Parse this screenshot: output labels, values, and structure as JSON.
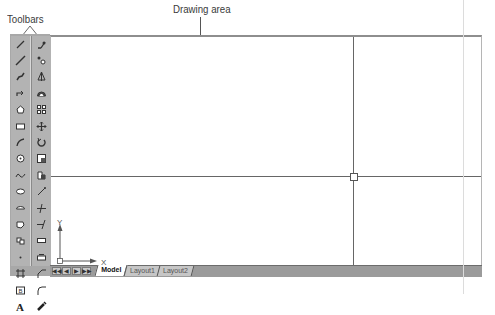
{
  "callouts": {
    "toolbars": "Toolbars",
    "drawing_area": "Drawing area",
    "crosshair_cursor": "Crosshair cursor",
    "ucs_icon_line1": "User Coordinate",
    "ucs_icon_line2": "System icon",
    "model_layout_tabs": "Model and Layout tabs"
  },
  "toolbars": {
    "draw": [
      "line-icon",
      "construction-line-icon",
      "polyline-icon",
      "polygon-icon",
      "rectangle-icon",
      "arc-icon",
      "circle-icon",
      "spline-icon",
      "ellipse-icon",
      "ellipse-arc-icon",
      "insert-block-icon",
      "make-block-icon",
      "point-icon",
      "hatch-icon",
      "region-icon",
      "multiline-text-icon"
    ],
    "modify": [
      "erase-icon",
      "copy-icon",
      "mirror-icon",
      "offset-icon",
      "array-icon",
      "move-icon",
      "rotate-icon",
      "scale-icon",
      "stretch-icon",
      "trim-icon",
      "extend-icon",
      "break-icon",
      "break-at-point-icon",
      "chamfer-icon",
      "fillet-icon",
      "explode-icon"
    ]
  },
  "ucs": {
    "x_label": "X",
    "y_label": "Y"
  },
  "tabs": {
    "nav": [
      "◀◀",
      "◀",
      "▶",
      "▶▶"
    ],
    "items": [
      {
        "label": "Model",
        "active": true
      },
      {
        "label": "Layout1",
        "active": false
      },
      {
        "label": "Layout2",
        "active": false
      }
    ]
  },
  "crosshair": {
    "x": 354,
    "y": 175
  },
  "colors": {
    "toolbar_bg": "#b3b3b3",
    "tabbar_bg": "#9b9b9b",
    "drawing_bg": "#ffffff",
    "crosshair": "#555555"
  }
}
